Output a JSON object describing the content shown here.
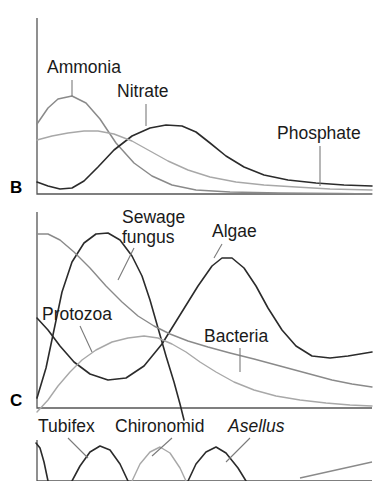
{
  "figure": {
    "type": "line",
    "background": "#ffffff"
  },
  "colors": {
    "dark_curve": "#2b2b2b",
    "mid_gray_curve": "#8a8a8a",
    "light_gray_curve": "#a8a8a8",
    "axis": "#555555",
    "leader": "#7a7a7a",
    "text": "#1a1a1a"
  },
  "panels": [
    {
      "letter": "B",
      "name": "chemicals",
      "labels": [
        {
          "text": "Ammonia",
          "x": 47,
          "y": 73
        },
        {
          "text": "Nitrate",
          "x": 117,
          "y": 97
        },
        {
          "text": "Phosphate",
          "x": 277,
          "y": 139
        }
      ]
    },
    {
      "letter": "C",
      "name": "micro-organisms",
      "labels": [
        {
          "text": "Sewage",
          "x": 122,
          "y": 223
        },
        {
          "text": "fungus",
          "x": 122,
          "y": 243
        },
        {
          "text": "Algae",
          "x": 212,
          "y": 237
        },
        {
          "text": "Protozoa",
          "x": 42,
          "y": 320
        },
        {
          "text": "Bacteria",
          "x": 204,
          "y": 342
        }
      ]
    },
    {
      "letter": "",
      "name": "invertebrates",
      "labels": [
        {
          "text": "Tubifex",
          "x": 38,
          "y": 432,
          "italic": false
        },
        {
          "text": "Chironomid",
          "x": 115,
          "y": 432,
          "italic": false
        },
        {
          "text": "Asellus",
          "x": 228,
          "y": 432,
          "italic": true
        }
      ]
    }
  ],
  "chart_data": {
    "type": "line",
    "title": "",
    "xlabel": "",
    "ylabel": "",
    "grid": false,
    "legend": "inline-labels",
    "panels": [
      {
        "id": "B",
        "letter": "B",
        "axis": {
          "x0": 37,
          "y_top": 18,
          "x1": 372,
          "y_base": 194
        },
        "series": [
          {
            "name": "Ammonia",
            "color": "#8a8a8a",
            "peak_x": 72,
            "points": "37,124 48,108 58,99 72,96 86,103 100,119 116,143 134,163 152,176 172,185 196,190 230,192 280,193 340,193.5 372,194"
          },
          {
            "name": "Nitrate",
            "color": "#2b2b2b",
            "peak_x": 166,
            "points": "37,182 48,186 60,189 72,188 84,181 98,167 114,150 132,136 150,128 166,125 182,126 196,132 210,143 226,156 244,167 264,175 288,180 316,183 344,185 372,186"
          },
          {
            "name": "Phosphate",
            "color": "#a8a8a8",
            "peak_x": 96,
            "points": "37,140 52,136 68,133 84,131 98,131 114,134 132,141 150,151 168,161 188,170 210,177 236,182 264,185 296,187 330,189 372,190"
          }
        ]
      },
      {
        "id": "C",
        "letter": "C",
        "axis": {
          "x0": 37,
          "y_top": 212,
          "x1": 372,
          "y_base": 408
        },
        "series": [
          {
            "name": "Sewage fungus",
            "color": "#2b2b2b",
            "peak_x": 78,
            "points": "37,398 46,368 54,330 62,292 72,262 84,243 96,234 108,233 120,240 132,256 142,276 150,300 158,328 166,356 174,382 180,404 184,420"
          },
          {
            "name": "Algae",
            "color": "#2b2b2b",
            "peak_x": 215,
            "points": "37,318 48,330 60,346 74,362 90,374 108,380 126,378 144,366 162,344 180,315 198,286 212,266 222,258 232,258 244,268 256,286 268,308 282,330 296,346 312,356 330,358 348,356 372,352"
          },
          {
            "name": "Protozoa",
            "color": "#a8a8a8",
            "peak_x": 150,
            "points": "37,412 48,400 58,386 70,372 82,360 96,350 112,342 128,338 144,336 158,338 172,344 186,352 200,362 216,372 234,382 254,390 276,396 300,400 326,403 350,405 372,406"
          },
          {
            "name": "Bacteria",
            "color": "#8a8a8a",
            "peak_x": 44,
            "points": "37,234 48,234 60,240 74,252 90,268 106,286 122,302 138,316 154,326 170,334 188,341 208,347 230,353 254,359 280,366 306,373 332,380 352,384 372,387"
          }
        ]
      },
      {
        "id": "D",
        "letter": "",
        "axis": {
          "x0": 37,
          "y_top": 440,
          "x1": 372,
          "y_base": 481
        },
        "series": [
          {
            "name": "Tubifex",
            "color": "#2b2b2b",
            "peak_x": 40,
            "points": "36,443 40,448 44,462 48,481"
          },
          {
            "name": "Tubifex-peak",
            "color": "#2b2b2b",
            "peak_x": 100,
            "points": "72,481 80,466 90,452 100,446 110,450 120,464 128,481"
          },
          {
            "name": "Chironomid",
            "color": "#a8a8a8",
            "peak_x": 158,
            "points": "132,481 140,464 150,452 160,447 170,453 180,468 186,481"
          },
          {
            "name": "Asellus",
            "color": "#2b2b2b",
            "peak_x": 216,
            "points": "188,481 196,464 206,452 216,447 226,453 238,468 246,481"
          }
        ]
      }
    ],
    "leaders": [
      {
        "panel": "B",
        "label": "Ammonia",
        "x1": 72,
        "y1": 80,
        "x2": 72,
        "y2": 96
      },
      {
        "panel": "B",
        "label": "Nitrate",
        "x1": 146,
        "y1": 104,
        "x2": 146,
        "y2": 126
      },
      {
        "panel": "B",
        "label": "Phosphate",
        "x1": 320,
        "y1": 146,
        "x2": 320,
        "y2": 186
      },
      {
        "panel": "C",
        "label": "Sewage fungus",
        "x1": 134,
        "y1": 248,
        "x2": 118,
        "y2": 280
      },
      {
        "panel": "C",
        "label": "Algae",
        "x1": 222,
        "y1": 244,
        "x2": 214,
        "y2": 258
      },
      {
        "panel": "C",
        "label": "Protozoa",
        "x1": 80,
        "y1": 326,
        "x2": 92,
        "y2": 352
      },
      {
        "panel": "C",
        "label": "Bacteria",
        "x1": 240,
        "y1": 348,
        "x2": 240,
        "y2": 372
      },
      {
        "panel": "D",
        "label": "Tubifex",
        "x1": 68,
        "y1": 438,
        "x2": 88,
        "y2": 458
      },
      {
        "panel": "D",
        "label": "Chironomid",
        "x1": 172,
        "y1": 438,
        "x2": 152,
        "y2": 456
      },
      {
        "panel": "D",
        "label": "Asellus",
        "x1": 250,
        "y1": 438,
        "x2": 226,
        "y2": 462
      }
    ]
  }
}
